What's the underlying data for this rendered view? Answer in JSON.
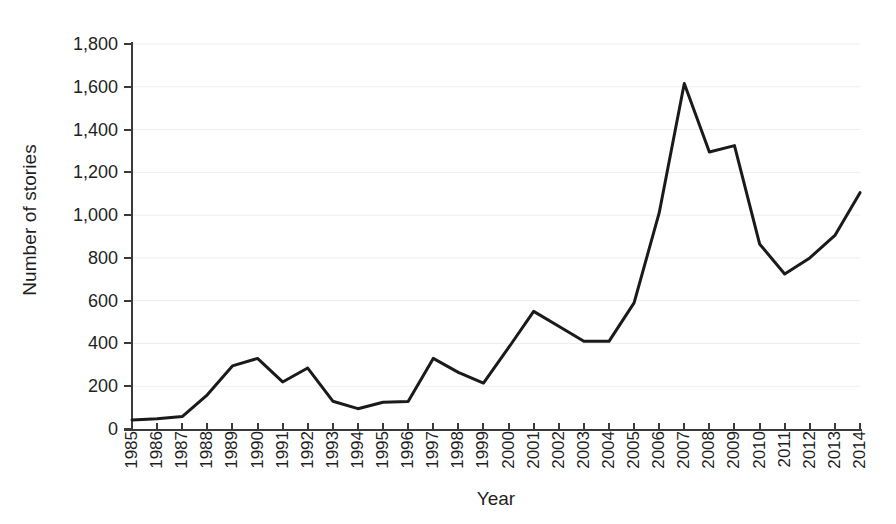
{
  "chart_data": {
    "type": "line",
    "title": "",
    "xlabel": "Year",
    "ylabel": "Number of stories",
    "categories": [
      "1985",
      "1986",
      "1987",
      "1988",
      "1989",
      "1990",
      "1991",
      "1992",
      "1993",
      "1994",
      "1995",
      "1996",
      "1997",
      "1998",
      "1999",
      "2000",
      "2001",
      "2002",
      "2003",
      "2004",
      "2005",
      "2006",
      "2007",
      "2008",
      "2009",
      "2010",
      "2011",
      "2012",
      "2013",
      "2014"
    ],
    "values": [
      42,
      48,
      58,
      160,
      295,
      330,
      220,
      285,
      130,
      95,
      125,
      128,
      330,
      265,
      215,
      380,
      550,
      480,
      410,
      410,
      590,
      1010,
      1615,
      1295,
      1325,
      865,
      725,
      800,
      905,
      1105
    ],
    "series": [
      {
        "name": "Number of stories",
        "color": "#1a1a1a",
        "values": [
          42,
          48,
          58,
          160,
          295,
          330,
          220,
          285,
          130,
          95,
          125,
          128,
          330,
          265,
          215,
          380,
          550,
          480,
          410,
          410,
          590,
          1010,
          1615,
          1295,
          1325,
          865,
          725,
          800,
          905,
          1105
        ]
      }
    ],
    "xlim": [
      1985,
      2014
    ],
    "ylim": [
      0,
      1800
    ],
    "ytick_values": [
      0,
      200,
      400,
      600,
      800,
      1000,
      1200,
      1400,
      1600,
      1800
    ],
    "ytick_labels": [
      "0",
      "200",
      "400",
      "600",
      "800",
      "1,000",
      "1,200",
      "1,400",
      "1,600",
      "1,800"
    ],
    "grid": "horizontal",
    "grid_color": "#ededed",
    "legend": "none",
    "line_color": "#1a1a1a",
    "line_width": 3,
    "background_color": "#ffffff",
    "axis_color": "#3a3a3a",
    "annotations": []
  }
}
